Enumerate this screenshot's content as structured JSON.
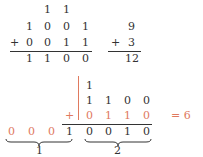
{
  "top": {
    "carries": [
      "1",
      "1"
    ],
    "row1": [
      "1",
      "0",
      "0",
      "1"
    ],
    "plus": "+",
    "row2": [
      "0",
      "0",
      "1",
      "1"
    ],
    "result": [
      "1",
      "1",
      "0",
      "0"
    ],
    "decimal": {
      "a": "9",
      "plus": "+",
      "b": "3",
      "sum": "12"
    }
  },
  "bottom": {
    "carry": "1",
    "row1": [
      "1",
      "1",
      "0",
      "0"
    ],
    "plus": "+",
    "row2": [
      "0",
      "1",
      "1",
      "0"
    ],
    "left_digits": [
      "0",
      "0",
      "0",
      "1"
    ],
    "right_digits": [
      "0",
      "0",
      "1",
      "0"
    ],
    "equals": "= 6",
    "brace_left_label": "1",
    "brace_right_label": "2"
  },
  "colors": {
    "text": "#333333",
    "accent": "#e07a5f"
  }
}
